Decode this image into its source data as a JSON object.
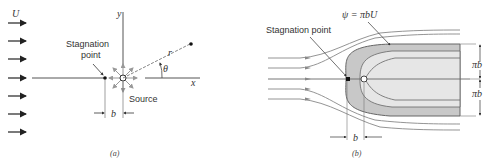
{
  "figure_a": {
    "caption": "(a)",
    "labels": {
      "freestream": "U",
      "y_axis": "y",
      "x_axis": "x",
      "radius": "r",
      "angle": "θ",
      "stagnation_line1": "Stagnation",
      "stagnation_line2": "point",
      "source": "Source",
      "spacing": "b"
    },
    "colors": {
      "line": "#555555",
      "arrow": "#222222",
      "source_arrows": "#999999"
    }
  },
  "figure_b": {
    "caption": "(b)",
    "labels": {
      "streamline_eq": "ψ = πbU",
      "stagnation": "Stagnation point",
      "half_width_upper": "πb",
      "half_width_lower": "πb",
      "spacing": "b"
    },
    "colors": {
      "body_outer": "#c8c8c8",
      "body_inner": "#e6e6e6",
      "streamline": "#888888"
    }
  }
}
